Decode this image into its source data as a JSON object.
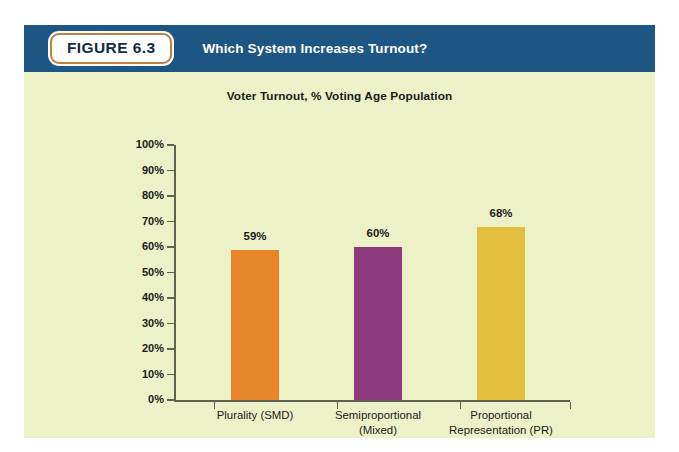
{
  "figure": {
    "badge_label": "FIGURE 6.3",
    "header_title": "Which System Increases Turnout?",
    "header_bg": "#1d5683",
    "badge_border": "#c08040",
    "panel_bg": "#ecf1c7"
  },
  "chart_data": {
    "type": "bar",
    "title": "Voter Turnout, % Voting Age Population",
    "xlabel": "",
    "ylabel": "",
    "ylim": [
      0,
      100
    ],
    "grid": false,
    "legend": "none",
    "categories": [
      "Plurality (SMD)",
      "Semiproportional\n(Mixed)",
      "Proportional\nRepresentation (PR)"
    ],
    "category_lines": [
      [
        "Plurality (SMD)"
      ],
      [
        "Semiproportional",
        "(Mixed)"
      ],
      [
        "Proportional",
        "Representation (PR)"
      ]
    ],
    "values": [
      59,
      60,
      68
    ],
    "value_labels": [
      "59%",
      "60%",
      "68%"
    ],
    "colors": [
      "#e8842a",
      "#8e3b7e",
      "#e2be3c"
    ],
    "ytick_labels": [
      "100%",
      "90%",
      "80%",
      "70%",
      "60%",
      "50%",
      "40%",
      "30%",
      "20%",
      "10%",
      "0%"
    ],
    "ytick_values": [
      100,
      90,
      80,
      70,
      60,
      50,
      40,
      30,
      20,
      10,
      0
    ]
  }
}
